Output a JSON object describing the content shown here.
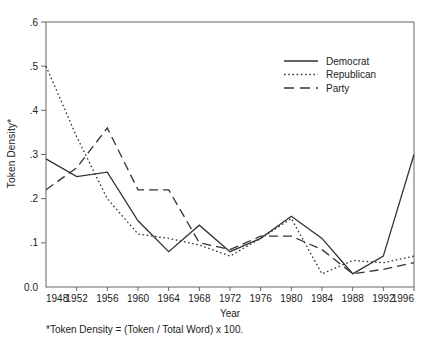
{
  "page": {
    "background_color": "#ffffff",
    "line_color": "#333333",
    "frame_color": "#666666",
    "text_color": "#222222"
  },
  "chart_data": {
    "type": "line",
    "title": "",
    "xlabel": "Year",
    "ylabel": "Token Density*",
    "footnote": "*Token Density = (Token / Total Word) x 100.",
    "x": [
      1948,
      1952,
      1956,
      1960,
      1964,
      1968,
      1972,
      1976,
      1980,
      1984,
      1988,
      1992,
      1996
    ],
    "x_tick_labels": [
      "1948",
      "1952",
      "1956",
      "1960",
      "1964",
      "1968",
      "1972",
      "1976",
      "1980",
      "1984",
      "1988",
      "1992",
      "1996"
    ],
    "y_ticks": [
      0,
      0.1,
      0.2,
      0.3,
      0.4,
      0.5,
      0.6
    ],
    "y_tick_labels": [
      "0.0",
      ".1",
      ".2",
      ".3",
      ".4",
      ".5",
      ".6"
    ],
    "ylim": [
      0,
      0.6
    ],
    "grid": false,
    "legend_position": "top-right-inside",
    "series": [
      {
        "name": "Democrat",
        "line_style": "solid",
        "values": [
          0.29,
          0.25,
          0.26,
          0.15,
          0.08,
          0.14,
          0.08,
          0.11,
          0.16,
          0.11,
          0.03,
          0.07,
          0.3
        ]
      },
      {
        "name": "Republican",
        "line_style": "dotted",
        "values": [
          0.5,
          0.34,
          0.2,
          0.12,
          0.11,
          0.095,
          0.07,
          0.11,
          0.155,
          0.03,
          0.06,
          0.055,
          0.07
        ]
      },
      {
        "name": "Party",
        "line_style": "dashed",
        "values": [
          0.22,
          0.27,
          0.36,
          0.22,
          0.22,
          0.1,
          0.085,
          0.115,
          0.115,
          0.085,
          0.03,
          0.04,
          0.055
        ]
      }
    ]
  }
}
